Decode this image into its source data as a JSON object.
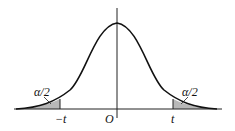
{
  "diagram": {
    "type": "t-distribution two-tailed critical region",
    "labels": {
      "left_tail": "α/2",
      "right_tail": "α/2",
      "left_critical": "−t",
      "origin": "O",
      "right_critical": "t"
    },
    "colors": {
      "curve": "#111111",
      "axis": "#222222",
      "shade": "#b8b8b8"
    }
  }
}
